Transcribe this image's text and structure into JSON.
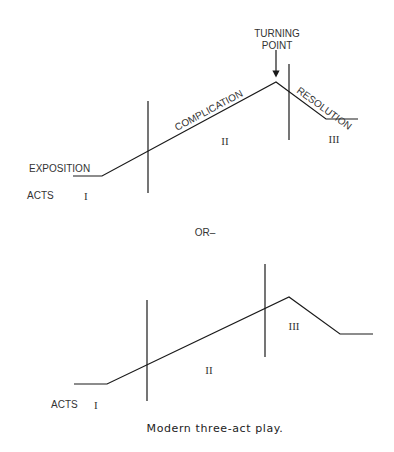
{
  "top_diagram": {
    "labels": {
      "turning_point_line1": "TURNING",
      "turning_point_line2": "POINT",
      "exposition": "EXPOSITION",
      "complication": "COMPLICATION",
      "resolution": "RESOLUTION",
      "acts": "ACTS",
      "act1": "I",
      "act2": "II",
      "act3": "III"
    }
  },
  "separator": {
    "label": "OR–"
  },
  "bottom_diagram": {
    "labels": {
      "acts": "ACTS",
      "act1": "I",
      "act2": "II",
      "act3": "III"
    }
  },
  "caption": "Modern three-act play."
}
